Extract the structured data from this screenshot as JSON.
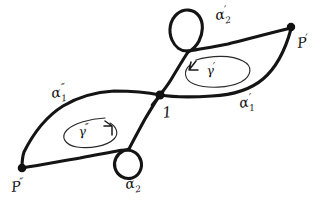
{
  "figure": {
    "kind": "hand-drawn-mathematical-diagram",
    "background_color": "#ffffff",
    "ink_color": "#141414"
  },
  "vertices": [
    {
      "id": "p-prime",
      "label": "P",
      "prime": "′",
      "position": {
        "x": 291,
        "y": 27
      },
      "label_position": {
        "x": 298,
        "y": 48
      }
    },
    {
      "id": "basepoint",
      "label": "1",
      "prime": "",
      "position": {
        "x": 160,
        "y": 95
      },
      "label_position": {
        "x": 163,
        "y": 118
      }
    },
    {
      "id": "p-double-prime",
      "label": "P",
      "prime": "″",
      "position": {
        "x": 22,
        "y": 168
      },
      "label_position": {
        "x": 12,
        "y": 192
      }
    }
  ],
  "arc_labels": [
    {
      "id": "alpha-2-prime",
      "base": "α",
      "subscript": "2",
      "prime": "′",
      "position": {
        "x": 216,
        "y": 20
      }
    },
    {
      "id": "alpha-1-prime",
      "base": "α",
      "subscript": "1",
      "prime": "′",
      "position": {
        "x": 240,
        "y": 108
      }
    },
    {
      "id": "alpha-1-double-prime",
      "base": "α",
      "subscript": "1",
      "prime": "″",
      "position": {
        "x": 52,
        "y": 98
      }
    },
    {
      "id": "alpha-2-double-prime",
      "base": "α",
      "subscript": "2",
      "prime": "″",
      "position": {
        "x": 126,
        "y": 189
      }
    }
  ],
  "cycle_labels": [
    {
      "id": "gamma-prime",
      "base": "γ",
      "prime": "′",
      "position": {
        "x": 214,
        "y": 72
      },
      "orientation": "counterclockwise",
      "arrow_direction": "left"
    },
    {
      "id": "gamma-double-prime",
      "base": "γ",
      "prime": "″",
      "position": {
        "x": 79,
        "y": 133
      },
      "orientation": "clockwise",
      "arrow_direction": "right"
    }
  ],
  "regions": [
    {
      "id": "right-lens",
      "contains_cycle": "gamma-prime",
      "vertices": [
        "basepoint",
        "p-prime"
      ]
    },
    {
      "id": "left-lens",
      "contains_cycle": "gamma-double-prime",
      "vertices": [
        "p-double-prime",
        "basepoint"
      ]
    }
  ],
  "small_loops": [
    {
      "id": "top-loop",
      "attached_to": "alpha-2-prime",
      "center": {
        "x": 192,
        "y": 30
      }
    },
    {
      "id": "bottom-loop",
      "attached_to": "alpha-2-double-prime",
      "center": {
        "x": 126,
        "y": 161
      }
    }
  ]
}
